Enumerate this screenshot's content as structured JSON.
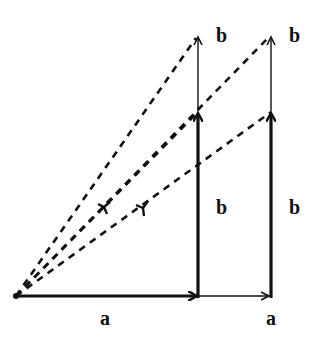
{
  "diagram": {
    "type": "vector-addition",
    "colors": {
      "stroke": "#111111",
      "background": "#ffffff"
    },
    "origin": [
      16,
      296
    ],
    "vectors": [
      {
        "id": "a1",
        "label": "a",
        "from": [
          16,
          296
        ],
        "to": [
          198,
          296
        ],
        "style": "thick"
      },
      {
        "id": "a2",
        "label": "a",
        "from": [
          198,
          296
        ],
        "to": [
          271,
          296
        ],
        "style": "thin"
      },
      {
        "id": "b1",
        "label": "b",
        "from": [
          198,
          296
        ],
        "to": [
          198,
          112
        ],
        "style": "thick"
      },
      {
        "id": "b2",
        "label": "b",
        "from": [
          271,
          296
        ],
        "to": [
          271,
          112
        ],
        "style": "thick"
      },
      {
        "id": "b3",
        "label": "b",
        "from": [
          198,
          112
        ],
        "to": [
          198,
          35
        ],
        "style": "thin"
      },
      {
        "id": "b4",
        "label": "b",
        "from": [
          271,
          112
        ],
        "to": [
          271,
          35
        ],
        "style": "thin"
      }
    ],
    "resultants": [
      {
        "id": "r1",
        "from": [
          16,
          296
        ],
        "to": [
          198,
          35
        ],
        "style": "dashed"
      },
      {
        "id": "r2",
        "from": [
          16,
          296
        ],
        "to": [
          198,
          112
        ],
        "style": "dashed",
        "marker": "Y"
      },
      {
        "id": "r3",
        "from": [
          16,
          296
        ],
        "to": [
          271,
          35
        ],
        "style": "dashed",
        "marker": "Y"
      },
      {
        "id": "r4",
        "from": [
          16,
          296
        ],
        "to": [
          271,
          112
        ],
        "style": "dashed"
      }
    ],
    "labels": {
      "a_left": "a",
      "a_right": "a",
      "b_top_left": "b",
      "b_top_right": "b",
      "b_mid_left": "b",
      "b_mid_right": "b"
    }
  }
}
